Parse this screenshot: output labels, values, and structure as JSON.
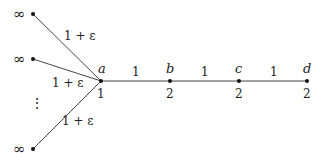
{
  "graph": {
    "nodes": [
      {
        "id": "inf1",
        "label": "∞",
        "value": ""
      },
      {
        "id": "inf2",
        "label": "∞",
        "value": ""
      },
      {
        "id": "inf3",
        "label": "∞",
        "value": ""
      },
      {
        "id": "a",
        "label": "a",
        "value": "1"
      },
      {
        "id": "b",
        "label": "b",
        "value": "2"
      },
      {
        "id": "c",
        "label": "c",
        "value": "2"
      },
      {
        "id": "d",
        "label": "d",
        "value": "2"
      }
    ],
    "edges": [
      {
        "from": "inf1",
        "to": "a",
        "weight": "1 + ε"
      },
      {
        "from": "inf2",
        "to": "a",
        "weight": "1 + ε"
      },
      {
        "from": "inf3",
        "to": "a",
        "weight": "1 + ε"
      },
      {
        "from": "a",
        "to": "b",
        "weight": "1"
      },
      {
        "from": "b",
        "to": "c",
        "weight": "1"
      },
      {
        "from": "c",
        "to": "d",
        "weight": "1"
      }
    ],
    "ellipsis": "⋮"
  }
}
